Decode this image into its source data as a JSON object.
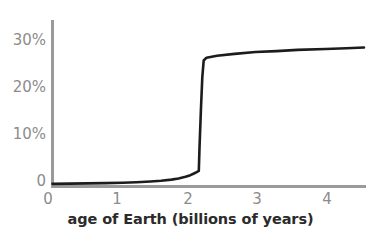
{
  "chart_data": {
    "type": "line",
    "title": "",
    "subtitle": "",
    "xlabel": "age of Earth (billions of years)",
    "ylabel": "",
    "xlim": [
      0,
      4.7
    ],
    "ylim": [
      0,
      33
    ],
    "grid": false,
    "legend": null,
    "annotations": [],
    "x_ticks": [
      {
        "value": 0,
        "label": "0"
      },
      {
        "value": 1,
        "label": "1"
      },
      {
        "value": 2,
        "label": "2"
      },
      {
        "value": 3,
        "label": "3"
      },
      {
        "value": 4,
        "label": "4"
      }
    ],
    "y_ticks": [
      {
        "value": 0,
        "label": "0"
      },
      {
        "value": 10,
        "label": "10%"
      },
      {
        "value": 20,
        "label": "20%"
      },
      {
        "value": 30,
        "label": "30%"
      }
    ],
    "series": [
      {
        "name": "atmospheric oxygen",
        "color": "#1c1c1c",
        "line_width": 2.6,
        "x": [
          0,
          0.25,
          0.5,
          0.75,
          1.0,
          1.2,
          1.4,
          1.55,
          1.7,
          1.8,
          1.9,
          1.97,
          2.02,
          2.06,
          2.09,
          2.1,
          2.12,
          2.14,
          2.16,
          2.2,
          2.35,
          2.6,
          2.9,
          3.2,
          3.5,
          3.9,
          4.2,
          4.45
        ],
        "y": [
          0.35,
          0.4,
          0.45,
          0.5,
          0.6,
          0.7,
          0.85,
          1.0,
          1.25,
          1.5,
          1.85,
          2.2,
          2.55,
          2.85,
          3.1,
          8.0,
          16.0,
          23.0,
          26.6,
          27.2,
          27.6,
          28.0,
          28.4,
          28.6,
          28.85,
          29.05,
          29.2,
          29.35
        ]
      }
    ]
  },
  "axes": {
    "y_axis_color": "#9a9a9a",
    "x_axis_color": "#9a9a9a",
    "tick_label_color": "#8c8c8c",
    "axis_title_color": "#2b2b2b"
  }
}
